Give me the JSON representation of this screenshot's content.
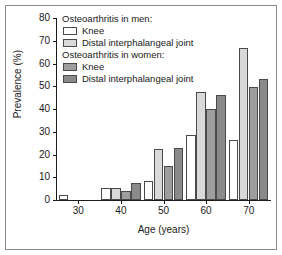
{
  "chart_data": {
    "type": "bar",
    "title": "",
    "xlabel": "Age (years)",
    "ylabel": "Prevalence (%)",
    "categories": [
      "30",
      "40",
      "50",
      "60",
      "70"
    ],
    "ylim": [
      0,
      80
    ],
    "yticks": [
      "0",
      "10",
      "20",
      "30",
      "40",
      "50",
      "60",
      "70",
      "80"
    ],
    "grid": false,
    "legend_position": "top-left",
    "series": [
      {
        "name": "Osteoarthritis in men: Knee",
        "short": "Knee",
        "group": "men",
        "color": "#ffffff",
        "values": [
          2,
          5.5,
          8.5,
          28.5,
          26.5
        ]
      },
      {
        "name": "Osteoarthritis in men: Distal interphalangeal joint",
        "short": "Distal interphalangeal joint",
        "group": "men",
        "color": "#d9d9d9",
        "values": [
          0,
          5.5,
          22.5,
          47.5,
          67
        ]
      },
      {
        "name": "Osteoarthritis in women: Knee",
        "short": "Knee",
        "group": "women",
        "color": "#9e9e9e",
        "values": [
          0,
          4,
          15,
          40,
          49.5
        ]
      },
      {
        "name": "Osteoarthritis in women: Distal interphalangeal joint",
        "short": "Distal interphalangeal joint",
        "group": "women",
        "color": "#8a8a8a",
        "values": [
          0,
          7.5,
          23,
          46,
          53
        ]
      }
    ]
  },
  "legend": {
    "men_heading": "Osteoarthritis in men:",
    "women_heading": "Osteoarthritis in women:",
    "men_knee": "Knee",
    "men_dip": "Distal interphalangeal joint",
    "women_knee": "Knee",
    "women_dip": "Distal interphalangeal joint"
  },
  "axes": {
    "ylabel": "Prevalence (%)",
    "xlabel": "Age (years)"
  }
}
